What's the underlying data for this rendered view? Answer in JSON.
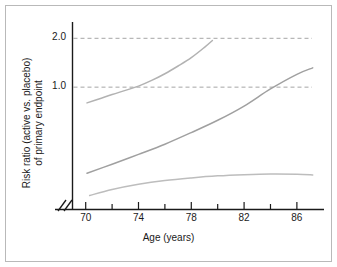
{
  "figure": {
    "background": "#ffffff",
    "border_color": "#b9b9b9",
    "axis_color": "#1a1a1a",
    "grid_color": "#9b9b9b",
    "curve_color": "#a8a8a8"
  },
  "chart_data": {
    "type": "line",
    "title": "",
    "subtitle": "",
    "xlabel": "Age (years)",
    "ylabel_line1": "Risk ratio (active vs. placebo)",
    "ylabel_line2": "of primary endpoint",
    "xlim": [
      69.0,
      87.6
    ],
    "ylim": [
      0.18,
      2.25
    ],
    "y_scale": "log",
    "grid": true,
    "gridlines_y": [
      1.0,
      2.0
    ],
    "legend": "none",
    "axis_break_x": true,
    "xticks_major": [
      70,
      74,
      78,
      82,
      86
    ],
    "xtick_labels": [
      "70",
      "74",
      "78",
      "82",
      "86"
    ],
    "xticks_minor": [
      72,
      76,
      80,
      84
    ],
    "yticks": [
      1.0,
      2.0
    ],
    "ytick_labels": [
      "1.0",
      "2.0"
    ],
    "annotations": [
      "Upper confidence limit crosses 1.0 near age 73.5",
      "Point estimate crosses 1.0 near age 84",
      "Upper confidence limit approaches 2.0 near age 79.5"
    ],
    "series": [
      {
        "name": "Upper confidence limit",
        "role": "upper-ci",
        "color": "#b2b2b2",
        "x": [
          70.1,
          71.0,
          72.0,
          73.0,
          74.0,
          75.0,
          76.0,
          77.0,
          78.0,
          79.0,
          79.6
        ],
        "y": [
          0.8,
          0.845,
          0.9,
          0.955,
          1.015,
          1.1,
          1.21,
          1.35,
          1.52,
          1.76,
          1.94
        ]
      },
      {
        "name": "Point estimate",
        "role": "estimate",
        "color": "#a0a0a0",
        "x": [
          70.1,
          72.0,
          74.0,
          76.0,
          78.0,
          80.0,
          82.0,
          84.0,
          86.0,
          87.2
        ],
        "y": [
          0.295,
          0.335,
          0.385,
          0.445,
          0.525,
          0.625,
          0.765,
          0.975,
          1.2,
          1.315
        ]
      },
      {
        "name": "Lower confidence limit",
        "role": "lower-ci",
        "color": "#bdbdbd",
        "x": [
          70.3,
          72.0,
          74.0,
          76.0,
          78.0,
          80.0,
          82.0,
          84.0,
          86.0,
          87.2
        ],
        "y": [
          0.215,
          0.234,
          0.252,
          0.266,
          0.276,
          0.284,
          0.289,
          0.292,
          0.291,
          0.288
        ]
      }
    ]
  }
}
